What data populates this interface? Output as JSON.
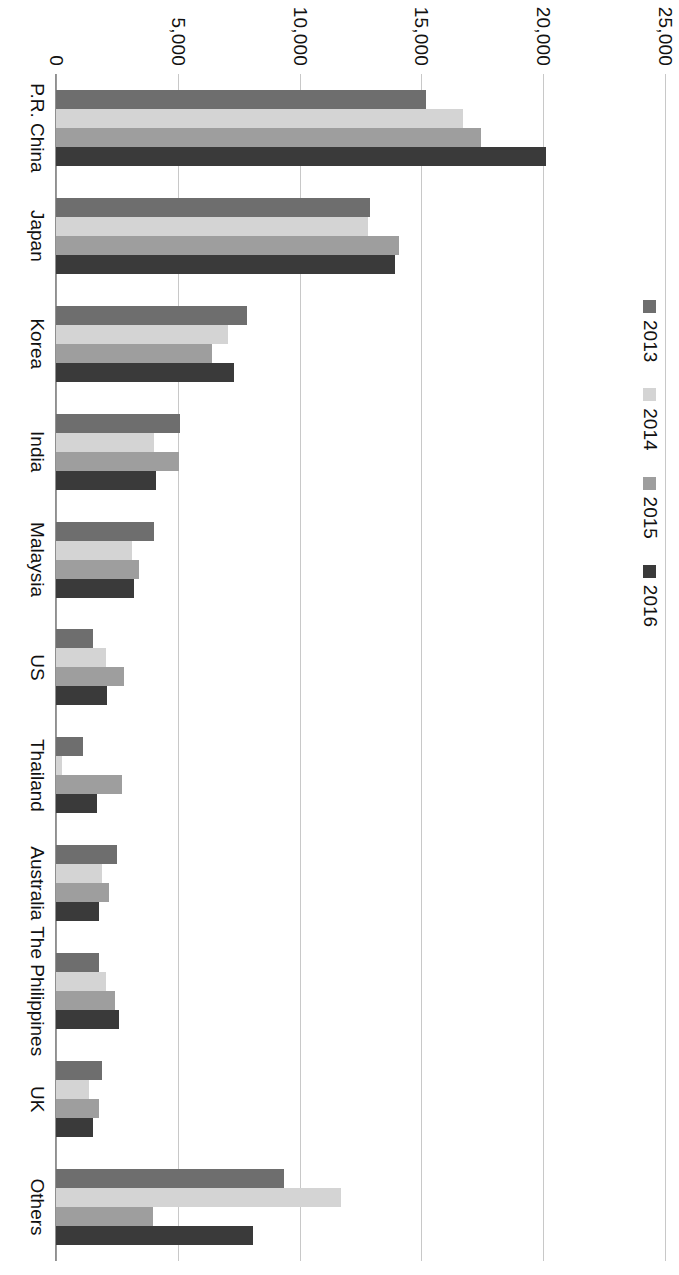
{
  "chart_data": {
    "type": "bar",
    "orientation": "vertical-rotated-90",
    "title": "",
    "subtitle": "",
    "xlabel": "",
    "ylabel": "",
    "ylim": [
      0,
      25000
    ],
    "ytick_values": [
      0,
      5000,
      10000,
      15000,
      20000,
      25000
    ],
    "ytick_labels": [
      "0",
      "5,000",
      "10,000",
      "15,000",
      "20,000",
      "25,000"
    ],
    "grid": true,
    "legend_position": "top-right",
    "categories": [
      "P.R. China",
      "Japan",
      "Korea",
      "India",
      "Malaysia",
      "US",
      "Thailand",
      "Australia",
      "The Philippines",
      "UK",
      "Others"
    ],
    "series": [
      {
        "name": "2013",
        "color": "#6e6e6e",
        "values": [
          15200,
          12900,
          7850,
          5100,
          4020,
          1500,
          1120,
          2500,
          1770,
          1880,
          9350
        ]
      },
      {
        "name": "2014",
        "color": "#d4d4d4",
        "values": [
          16700,
          12800,
          7050,
          4030,
          3100,
          2050,
          250,
          1900,
          2070,
          1350,
          11700
        ]
      },
      {
        "name": "2015",
        "color": "#9e9e9e",
        "values": [
          17450,
          14100,
          6400,
          5050,
          3400,
          2800,
          2700,
          2180,
          2440,
          1750,
          4000
        ]
      },
      {
        "name": "2016",
        "color": "#3a3a3a",
        "values": [
          20100,
          13900,
          7300,
          4100,
          3200,
          2100,
          1700,
          1760,
          2600,
          1500,
          8100
        ]
      }
    ]
  },
  "legend": {
    "entries": [
      {
        "label": "2013",
        "color": "#6e6e6e"
      },
      {
        "label": "2014",
        "color": "#d4d4d4"
      },
      {
        "label": "2015",
        "color": "#9e9e9e"
      },
      {
        "label": "2016",
        "color": "#3a3a3a"
      }
    ]
  },
  "colors": {
    "series_2013": "#6e6e6e",
    "series_2014": "#d4d4d4",
    "series_2015": "#9e9e9e",
    "series_2016": "#3a3a3a",
    "gridline": "#c8c8c8",
    "axis": "#8f8f8f",
    "text": "#111111",
    "background": "#ffffff"
  }
}
